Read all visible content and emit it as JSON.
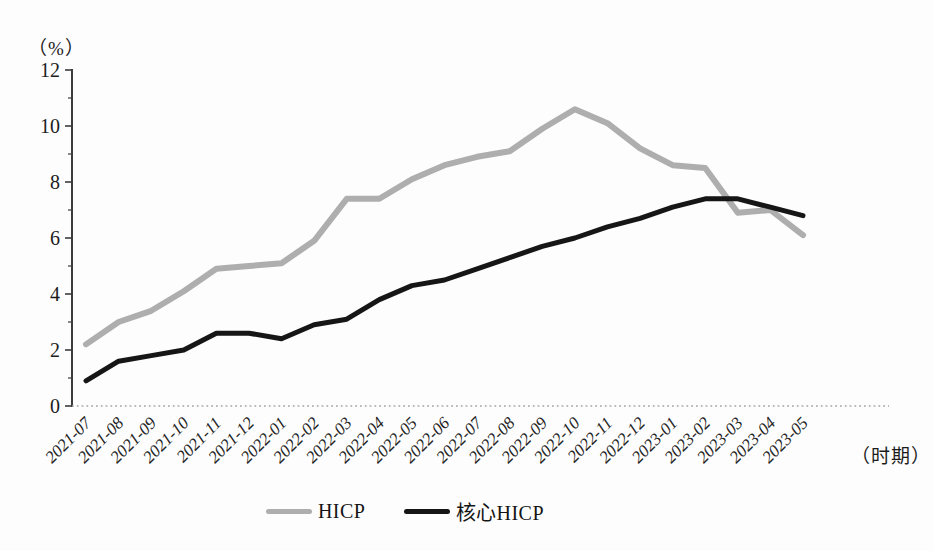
{
  "chart_data": {
    "type": "line",
    "title": "",
    "y_unit_label": "（%）",
    "x_unit_label": "（时期）",
    "xlabel": "时期",
    "ylabel": "%",
    "ylim": [
      0,
      12
    ],
    "y_ticks": [
      0,
      2,
      4,
      6,
      8,
      10,
      12
    ],
    "y_minor_ticks": [
      1,
      3,
      5,
      7,
      9,
      11
    ],
    "grid": false,
    "legend_position": "bottom-center",
    "x_tick_rotation": 45,
    "categories": [
      "2021-07",
      "2021-08",
      "2021-09",
      "2021-10",
      "2021-11",
      "2021-12",
      "2022-01",
      "2022-02",
      "2022-03",
      "2022-04",
      "2022-05",
      "2022-06",
      "2022-07",
      "2022-08",
      "2022-09",
      "2022-10",
      "2022-11",
      "2022-12",
      "2023-01",
      "2023-02",
      "2023-03",
      "2023-04",
      "2023-05"
    ],
    "series": [
      {
        "name": "HICP",
        "color": "#aeaeae",
        "values": [
          2.2,
          3.0,
          3.4,
          4.1,
          4.9,
          5.0,
          5.1,
          5.9,
          7.4,
          7.4,
          8.1,
          8.6,
          8.9,
          9.1,
          9.9,
          10.6,
          10.1,
          9.2,
          8.6,
          8.5,
          6.9,
          7.0,
          6.1
        ]
      },
      {
        "name": "核心HICP",
        "color": "#161616",
        "values": [
          0.9,
          1.6,
          1.8,
          2.0,
          2.6,
          2.6,
          2.4,
          2.9,
          3.1,
          3.8,
          4.3,
          4.5,
          4.9,
          5.3,
          5.7,
          6.0,
          6.4,
          6.7,
          7.1,
          7.4,
          7.4,
          7.1,
          6.8
        ]
      }
    ],
    "axis_color": "#3c3c3c",
    "baseline_color": "#a5a5a5"
  }
}
